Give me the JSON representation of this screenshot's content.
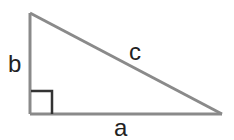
{
  "diagram": {
    "type": "right-triangle",
    "labels": {
      "vertical_leg": "b",
      "hypotenuse": "c",
      "horizontal_leg": "a"
    },
    "colors": {
      "sides": "#8a8a8a",
      "right_angle_mark": "#333333",
      "labels": "#222222"
    }
  }
}
